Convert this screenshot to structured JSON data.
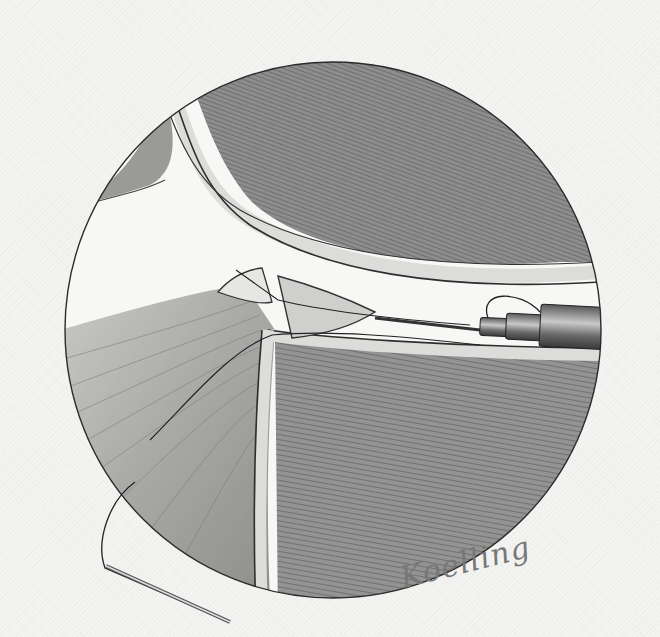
{
  "illustration": {
    "subject": "arthroscopic view of joint with suture needle and cannula instrument",
    "style": "graphite pencil drawing",
    "signature": "Koelling",
    "colors": {
      "paper": "#f4f4f2",
      "outline": "#2a2a2a",
      "bone_shading": "#8a8a8a",
      "cartilage": "#d8d8d6",
      "soft_tissue": "#b5b5b3"
    }
  }
}
